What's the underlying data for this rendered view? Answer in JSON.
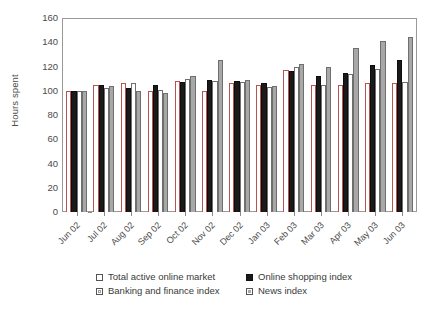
{
  "chart_data": {
    "type": "bar",
    "title": "",
    "xlabel": "",
    "ylabel": "Hours spent",
    "ylim": [
      0,
      160
    ],
    "y_ticks": [
      0,
      20,
      40,
      60,
      80,
      100,
      120,
      140,
      160
    ],
    "grid": false,
    "legend_position": "bottom",
    "categories": [
      "Jun 02",
      "Jul 02",
      "Aug 02",
      "Sep 02",
      "Oct 02",
      "Nov 02",
      "Dec 02",
      "Jan 03",
      "Feb 03",
      "Mar 03",
      "Apr 03",
      "May 03",
      "Jun 03"
    ],
    "series": [
      {
        "name": "Total active online market",
        "color": "#ffffff",
        "values": [
          100,
          105,
          106,
          100,
          108,
          100,
          106,
          105,
          117,
          105,
          105,
          106,
          106
        ]
      },
      {
        "name": "Online shopping index",
        "color": "#1a1a1a",
        "values": [
          100,
          105,
          102,
          105,
          107,
          109,
          108,
          106,
          116,
          112,
          115,
          121,
          125
        ]
      },
      {
        "name": "Banking and finance index",
        "color": "#ffffff",
        "values": [
          100,
          102,
          106,
          101,
          110,
          108,
          107,
          103,
          120,
          105,
          114,
          118,
          107
        ]
      },
      {
        "name": "News index",
        "color": "#a8a8a8",
        "values": [
          100,
          104,
          100,
          98,
          112,
          125,
          109,
          104,
          122,
          120,
          135,
          141,
          144
        ]
      }
    ]
  },
  "legend": {
    "items": [
      {
        "label": "Total active online market",
        "swatch": "s-total"
      },
      {
        "label": "Online shopping index",
        "swatch": "s-shopping"
      },
      {
        "label": "Banking and finance index",
        "swatch": "s-banking"
      },
      {
        "label": "News index",
        "swatch": "s-news"
      }
    ]
  }
}
